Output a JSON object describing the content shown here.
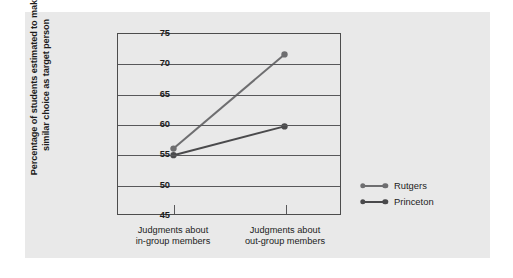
{
  "chart_data": {
    "type": "line",
    "title": "",
    "xlabel": "",
    "ylabel": "Percentage of students estimated to make similar choice as target person",
    "categories": [
      "Judgments about in-group members",
      "Judgments about out-group members"
    ],
    "category_lines": [
      [
        "Judgments about",
        "in-group members"
      ],
      [
        "Judgments about",
        "out-group members"
      ]
    ],
    "series": [
      {
        "name": "Rutgers",
        "values": [
          55.9,
          71.6
        ],
        "color": "#6e6e70"
      },
      {
        "name": "Princeton",
        "values": [
          54.8,
          59.6
        ],
        "color": "#4a4a4c"
      }
    ],
    "ylim": [
      45,
      75
    ],
    "yticks": [
      75,
      70,
      65,
      60,
      55,
      50,
      45
    ],
    "ytick_labels": [
      "75",
      "70",
      "65",
      "60",
      "55",
      "50",
      "45"
    ],
    "grid": true,
    "gridlines_at": [
      70,
      65,
      60,
      55,
      50
    ],
    "legend_position": "right"
  },
  "legend": {
    "entries": [
      {
        "label": "Rutgers"
      },
      {
        "label": "Princeton"
      }
    ]
  },
  "colors": {
    "panel_background": "#e9e9e9",
    "axis": "#4d4d4d",
    "grid": "#58585a",
    "text": "#1c1c1c",
    "rutgers": "#6e6e70",
    "princeton": "#4a4a4c"
  }
}
